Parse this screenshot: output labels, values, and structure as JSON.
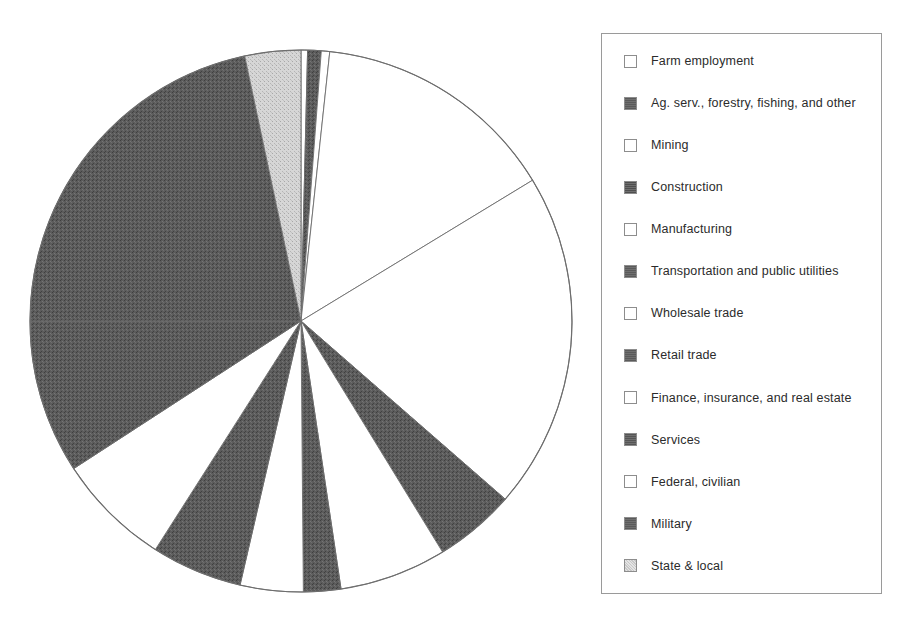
{
  "chart_data": {
    "type": "pie",
    "title": "",
    "subtitle": "",
    "legend_position": "right",
    "grid": false,
    "start_angle_deg": 0,
    "direction": "clockwise",
    "center": {
      "x": 301,
      "y": 321
    },
    "radius": 271,
    "categories": [
      "Farm employment",
      "Ag. serv., forestry, fishing, and other",
      "Mining",
      "Construction",
      "Manufacturing",
      "Transportation and public utilities",
      "Wholesale trade",
      "Retail trade",
      "Finance, insurance, and real estate",
      "Services",
      "Federal, civilian",
      "Military",
      "State & local"
    ],
    "values": [
      0.4,
      0.8,
      0.5,
      14.6,
      22.9,
      4.6,
      4.4,
      17.6,
      7.3,
      9.7,
      2.1,
      1.0,
      14.1
    ],
    "unit": "percent of total employment",
    "slices": [
      {
        "label": "Farm employment",
        "value": 0.4,
        "start_deg": 0.0,
        "end_deg": 1.4,
        "fill": "#ffffff",
        "pattern": "solid"
      },
      {
        "label": "Ag. serv., forestry, fishing, and other",
        "value": 0.8,
        "start_deg": 1.4,
        "end_deg": 4.3,
        "fill": "#545454",
        "pattern": "dark-stipple"
      },
      {
        "label": "Mining",
        "value": 0.5,
        "start_deg": 4.3,
        "end_deg": 6.1,
        "fill": "#ffffff",
        "pattern": "solid"
      },
      {
        "label": "Construction",
        "value": 14.6,
        "start_deg": 6.1,
        "end_deg": 58.7,
        "fill": "#ffffff",
        "pattern": "solid"
      },
      {
        "label": "Manufacturing",
        "value": 22.9,
        "start_deg": 58.7,
        "end_deg": 131.1,
        "fill": "#ffffff",
        "pattern": "solid"
      },
      {
        "label": "Transportation and public utilities",
        "value": 4.6,
        "start_deg": 131.1,
        "end_deg": 148.5,
        "fill": "#545454",
        "pattern": "dark-stipple"
      },
      {
        "label": "Wholesale trade",
        "value": 4.4,
        "start_deg": 148.5,
        "end_deg": 171.5,
        "fill": "#ffffff",
        "pattern": "solid"
      },
      {
        "label": "Retail trade",
        "value": 17.6,
        "start_deg": 171.5,
        "end_deg": 179.5,
        "fill": "#545454",
        "pattern": "dark-stipple"
      },
      {
        "label": "Finance, insurance, and real estate",
        "value": 7.3,
        "start_deg": 179.5,
        "end_deg": 193.0,
        "fill": "#ffffff",
        "pattern": "solid"
      },
      {
        "label": "Services",
        "value": 9.7,
        "start_deg": 193.0,
        "end_deg": 212.5,
        "fill": "#545454",
        "pattern": "dark-stipple"
      },
      {
        "label": "Federal, civilian",
        "value": 2.1,
        "start_deg": 212.5,
        "end_deg": 237.0,
        "fill": "#ffffff",
        "pattern": "solid"
      },
      {
        "label": "Military",
        "value": 1.0,
        "start_deg": 237.0,
        "end_deg": 270.0,
        "fill": "#545454",
        "pattern": "dark-stipple"
      },
      {
        "label": "State & local",
        "value": 14.1,
        "start_deg": 270.0,
        "end_deg": 348.0,
        "fill": "#545454",
        "pattern": "dark-stipple"
      },
      {
        "label": "State & local (top)",
        "value": 0,
        "start_deg": 348.0,
        "end_deg": 360.0,
        "fill": "#cfcfcf",
        "pattern": "light-stipple"
      }
    ]
  },
  "legend": {
    "items": [
      {
        "label": "Farm employment",
        "swatch": "white",
        "swatch_color": "#ffffff"
      },
      {
        "label": "Ag. serv., forestry, fishing, and other",
        "swatch": "dark",
        "swatch_color": "#5a5a5a"
      },
      {
        "label": "Mining",
        "swatch": "white",
        "swatch_color": "#ffffff"
      },
      {
        "label": "Construction",
        "swatch": "dark",
        "swatch_color": "#4f4f4f"
      },
      {
        "label": "Manufacturing",
        "swatch": "white",
        "swatch_color": "#ffffff"
      },
      {
        "label": "Transportation and public utilities",
        "swatch": "dark",
        "swatch_color": "#5a5a5a"
      },
      {
        "label": "Wholesale trade",
        "swatch": "white",
        "swatch_color": "#ffffff"
      },
      {
        "label": "Retail trade",
        "swatch": "dark",
        "swatch_color": "#5a5a5a"
      },
      {
        "label": "Finance, insurance, and real estate",
        "swatch": "white",
        "swatch_color": "#ffffff"
      },
      {
        "label": "Services",
        "swatch": "dark",
        "swatch_color": "#555555"
      },
      {
        "label": "Federal, civilian",
        "swatch": "white",
        "swatch_color": "#ffffff"
      },
      {
        "label": "Military",
        "swatch": "dark",
        "swatch_color": "#5a5a5a"
      },
      {
        "label": "State & local",
        "swatch": "light-stipple",
        "swatch_color": "#c8c8c8"
      }
    ]
  }
}
